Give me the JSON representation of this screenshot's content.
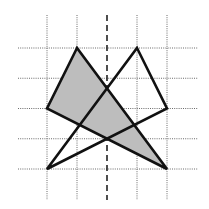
{
  "diagram": {
    "grid": {
      "columns": 5,
      "rows": 5,
      "symmetry_axis_column": 2
    },
    "shapes": [
      {
        "name": "shaded-triangle",
        "vertices": [
          [
            1,
            0
          ],
          [
            0,
            2
          ],
          [
            4,
            4
          ]
        ],
        "fill": "#bdbdbd"
      },
      {
        "name": "outline-triangle",
        "vertices": [
          [
            3,
            0
          ],
          [
            4,
            2
          ],
          [
            0,
            4
          ]
        ],
        "fill": "none"
      }
    ],
    "colors": {
      "stroke": "#111111",
      "shade": "#bdbdbd",
      "grid": "#6a6a6a"
    }
  }
}
